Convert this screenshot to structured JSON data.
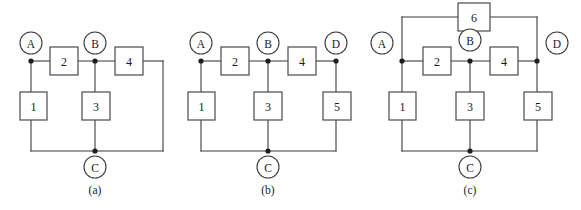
{
  "figure": {
    "width": 581,
    "height": 210,
    "background": "#ffffff",
    "wire_color": "#3b3b3b",
    "box_stroke": "#4a4a4a",
    "text_color": "#1a1a1a",
    "node_dot_color": "#1d1d1d"
  },
  "panels": [
    {
      "id": "a",
      "caption": "(a)",
      "caption_x": 95,
      "caption_y": 190,
      "terminals": [
        {
          "label": "A",
          "circle_cx": 31,
          "circle_cy": 43,
          "r": 11,
          "node_x": 31,
          "node_y": 61
        },
        {
          "label": "B",
          "circle_cx": 95,
          "circle_cy": 43,
          "r": 11,
          "node_x": 95,
          "node_y": 61
        },
        {
          "label": "C",
          "circle_cx": 95,
          "circle_cy": 167,
          "r": 11,
          "node_x": 95,
          "node_y": 151
        }
      ],
      "components": [
        {
          "label": "1",
          "x": 20,
          "y": 92,
          "w": 27,
          "h": 28,
          "orientation": "vertical"
        },
        {
          "label": "2",
          "x": 50,
          "y": 47,
          "w": 28,
          "h": 28,
          "orientation": "horizontal"
        },
        {
          "label": "3",
          "x": 82,
          "y": 92,
          "w": 28,
          "h": 28,
          "orientation": "vertical"
        },
        {
          "label": "4",
          "x": 115,
          "y": 47,
          "w": 28,
          "h": 28,
          "orientation": "horizontal"
        }
      ],
      "wires": [
        "M31,61 L50,61",
        "M78,61 L115,61",
        "M143,61 L163,61",
        "M163,61 L163,151",
        "M31,61 L31,92",
        "M31,120 L31,151",
        "M95,61 L95,92",
        "M95,120 L95,151",
        "M31,151 L163,151"
      ]
    },
    {
      "id": "b",
      "caption": "(b)",
      "caption_x": 268,
      "caption_y": 190,
      "terminals": [
        {
          "label": "A",
          "circle_cx": 201,
          "circle_cy": 43,
          "r": 11,
          "node_x": 201,
          "node_y": 61
        },
        {
          "label": "B",
          "circle_cx": 268,
          "circle_cy": 43,
          "r": 11,
          "node_x": 268,
          "node_y": 61
        },
        {
          "label": "D",
          "circle_cx": 336,
          "circle_cy": 43,
          "r": 11,
          "node_x": 336,
          "node_y": 61
        },
        {
          "label": "C",
          "circle_cx": 268,
          "circle_cy": 167,
          "r": 11,
          "node_x": 268,
          "node_y": 151
        }
      ],
      "components": [
        {
          "label": "1",
          "x": 188,
          "y": 92,
          "w": 27,
          "h": 28,
          "orientation": "vertical"
        },
        {
          "label": "2",
          "x": 221,
          "y": 47,
          "w": 28,
          "h": 28,
          "orientation": "horizontal"
        },
        {
          "label": "3",
          "x": 254,
          "y": 92,
          "w": 28,
          "h": 28,
          "orientation": "vertical"
        },
        {
          "label": "4",
          "x": 288,
          "y": 47,
          "w": 28,
          "h": 28,
          "orientation": "horizontal"
        },
        {
          "label": "5",
          "x": 323,
          "y": 92,
          "w": 28,
          "h": 28,
          "orientation": "vertical"
        }
      ],
      "wires": [
        "M201,61 L221,61",
        "M249,61 L288,61",
        "M316,61 L336,61",
        "M201,61 L201,92",
        "M201,120 L201,151",
        "M268,61 L268,92",
        "M268,120 L268,151",
        "M336,61 L336,92",
        "M336,120 L336,151",
        "M201,151 L336,151"
      ]
    },
    {
      "id": "c",
      "caption": "(c)",
      "caption_x": 470,
      "caption_y": 190,
      "terminals": [
        {
          "label": "A",
          "circle_cx": 382,
          "circle_cy": 43,
          "r": 11,
          "node_x": 402,
          "node_y": 61
        },
        {
          "label": "B",
          "circle_cx": 470,
          "circle_cy": 40,
          "r": 11,
          "node_x": 470,
          "node_y": 61
        },
        {
          "label": "D",
          "circle_cx": 557,
          "circle_cy": 43,
          "r": 11,
          "node_x": 537,
          "node_y": 61
        },
        {
          "label": "C",
          "circle_cx": 470,
          "circle_cy": 167,
          "r": 11,
          "node_x": 470,
          "node_y": 151
        }
      ],
      "components": [
        {
          "label": "1",
          "x": 389,
          "y": 92,
          "w": 27,
          "h": 28,
          "orientation": "vertical"
        },
        {
          "label": "2",
          "x": 423,
          "y": 47,
          "w": 28,
          "h": 28,
          "orientation": "horizontal"
        },
        {
          "label": "3",
          "x": 456,
          "y": 92,
          "w": 28,
          "h": 28,
          "orientation": "vertical"
        },
        {
          "label": "4",
          "x": 490,
          "y": 47,
          "w": 28,
          "h": 28,
          "orientation": "horizontal"
        },
        {
          "label": "5",
          "x": 524,
          "y": 92,
          "w": 28,
          "h": 28,
          "orientation": "vertical"
        },
        {
          "label": "6",
          "x": 458,
          "y": 3,
          "w": 32,
          "h": 28,
          "orientation": "horizontal"
        }
      ],
      "wires": [
        "M402,61 L423,61",
        "M451,61 L490,61",
        "M518,61 L537,61",
        "M402,61 L402,92",
        "M402,120 L402,151",
        "M470,61 L470,92",
        "M470,120 L470,151",
        "M537,61 L537,92",
        "M537,120 L537,151",
        "M402,151 L537,151",
        "M402,61 L402,17",
        "M402,17 L458,17",
        "M490,17 L537,17",
        "M537,17 L537,61"
      ]
    }
  ]
}
